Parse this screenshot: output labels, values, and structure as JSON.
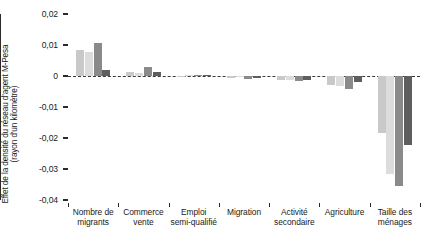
{
  "chart_data": {
    "type": "bar",
    "title": "",
    "xlabel": "",
    "ylabel": "Effet de la densité du réseau d'agent M-Pesa (rayon d'un kilomètre)",
    "ylabel_lines": [
      "Effet de la densité du réseau d'agent M-Pesa",
      "(rayon d'un kilomètre)"
    ],
    "ylim": [
      -0.04,
      0.02
    ],
    "ytick_labels": [
      "0,02",
      "0,01",
      "0",
      "-0,01",
      "-0,02",
      "-0,03",
      "-0,04"
    ],
    "ytick_values": [
      0.02,
      0.01,
      0,
      -0.01,
      -0.02,
      -0.03,
      -0.04
    ],
    "grid": false,
    "zero_line": true,
    "legend": "none",
    "categories": [
      "Nombre de migrants",
      "Commerce vente",
      "Emploi semi-qualifié",
      "Migration",
      "Activité secondaire",
      "Agriculture",
      "Taille des ménages"
    ],
    "category_lines": [
      [
        "Nombre de",
        "migrants"
      ],
      [
        "Commerce",
        "vente"
      ],
      [
        "Emploi",
        "semi-qualifié"
      ],
      [
        "Migration",
        ""
      ],
      [
        "Activité",
        "secondaire"
      ],
      [
        "Agriculture",
        ""
      ],
      [
        "Taille des",
        "ménages"
      ]
    ],
    "series": [
      {
        "name": "Série 1",
        "color": "#c9c9c9",
        "values": [
          0.0085,
          0.0012,
          0.0,
          -0.0006,
          -0.0014,
          -0.0028,
          -0.0185
        ]
      },
      {
        "name": "Série 2",
        "color": "#dcdcdc",
        "values": [
          0.0077,
          0.001,
          0.0002,
          -0.0004,
          -0.0012,
          -0.0032,
          -0.0315
        ]
      },
      {
        "name": "Série 3",
        "color": "#8a8a8a",
        "values": [
          0.0107,
          0.0028,
          0.0003,
          -0.001,
          -0.0016,
          -0.0043,
          -0.0355
        ]
      },
      {
        "name": "Série 4",
        "color": "#5e5e5e",
        "values": [
          0.002,
          0.0013,
          0.0004,
          -0.0008,
          -0.0013,
          -0.0018,
          -0.0222
        ]
      }
    ]
  }
}
